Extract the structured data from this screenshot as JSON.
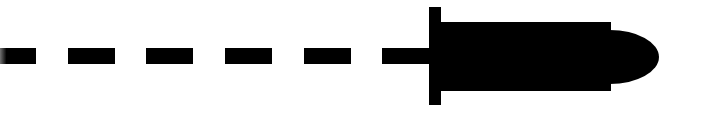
{
  "icon": {
    "name": "bullet-with-dashed-trail",
    "fill": "#000000",
    "background": "#ffffff"
  },
  "trail": {
    "dashes": [
      {
        "x": 0,
        "width": 36
      },
      {
        "x": 68,
        "width": 47
      },
      {
        "x": 146,
        "width": 47
      },
      {
        "x": 225,
        "width": 47
      },
      {
        "x": 304,
        "width": 47
      }
    ],
    "y": 48,
    "height": 16
  },
  "stub": {
    "x": 382,
    "y": 48,
    "width": 47,
    "height": 16
  },
  "crossbar": {
    "x": 429,
    "y": 7,
    "width": 12,
    "height": 98
  },
  "body": {
    "x": 441,
    "y": 22,
    "width": 170,
    "height": 69
  },
  "nose": {
    "x": 611,
    "y": 30,
    "width": 49,
    "height": 54
  }
}
